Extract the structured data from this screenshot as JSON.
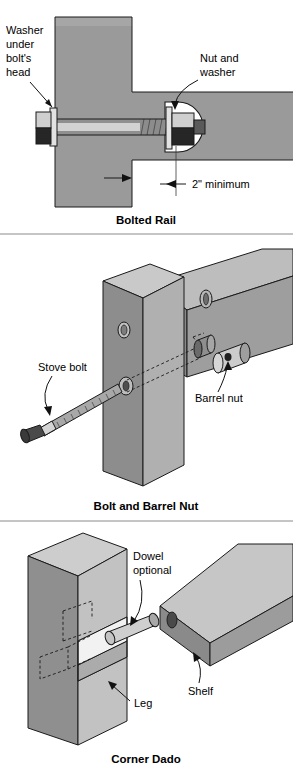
{
  "page": {
    "background_color": "#ffffff",
    "ink_color": "#1a1a1a"
  },
  "palette": {
    "wood_face": "#9a9a9a",
    "wood_light": "#c4c4c4",
    "wood_top": "#bdbdbd",
    "wood_dark": "#7d7d7d",
    "wood_darker": "#6e6e6e",
    "metal_light": "#d8d8d8",
    "metal_mid": "#9e9e9e",
    "metal_dark": "#2b2b2b",
    "hole_white": "#ffffff"
  },
  "figures": [
    {
      "id": "bolted-rail",
      "caption": "Bolted Rail",
      "labels": [
        {
          "name": "washer-under-bolt-head",
          "lines": [
            "Washer",
            "under",
            "bolt's",
            "head"
          ],
          "x": 6,
          "y": 34
        },
        {
          "name": "nut-and-washer",
          "lines": [
            "Nut and",
            "washer"
          ],
          "x": 200,
          "y": 62
        },
        {
          "name": "two-inch-minimum",
          "lines": [
            "2\" minimum"
          ],
          "x": 196,
          "y": 184
        }
      ],
      "parts": [
        "post",
        "rail",
        "carriage-bolt",
        "bolt-head-washer",
        "counterbore-pocket",
        "nut",
        "nut-washer"
      ],
      "dimension": {
        "name": "minimum-edge-distance",
        "value": "2\"",
        "qualifier": "minimum"
      }
    },
    {
      "id": "bolt-and-barrel-nut",
      "caption": "Bolt and Barrel Nut",
      "labels": [
        {
          "name": "stove-bolt",
          "lines": [
            "Stove bolt"
          ],
          "x": 38,
          "y": 371
        },
        {
          "name": "barrel-nut",
          "lines": [
            "Barrel nut"
          ],
          "x": 195,
          "y": 402
        }
      ],
      "parts": [
        "post",
        "rail",
        "stove-bolt",
        "barrel-nut",
        "bolt-hole",
        "barrel-nut-hole",
        "hidden-bore"
      ]
    },
    {
      "id": "corner-dado",
      "caption": "Corner Dado",
      "labels": [
        {
          "name": "dowel-optional",
          "lines": [
            "Dowel",
            "optional"
          ],
          "x": 133,
          "y": 556
        },
        {
          "name": "leg",
          "lines": [
            "Leg"
          ],
          "x": 134,
          "y": 703
        },
        {
          "name": "shelf",
          "lines": [
            "Shelf"
          ],
          "x": 188,
          "y": 692
        }
      ],
      "parts": [
        "leg",
        "shelf",
        "dado-notch",
        "dowel",
        "dowel-hole",
        "hidden-dowel-bore"
      ]
    }
  ]
}
